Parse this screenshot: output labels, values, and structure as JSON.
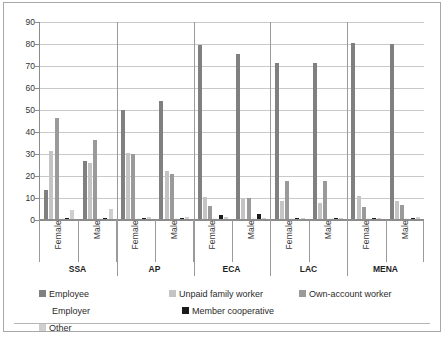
{
  "chart_data": {
    "type": "bar",
    "title": "",
    "subtitle": "",
    "xlabel": "",
    "ylabel": "",
    "ylim": [
      0,
      90
    ],
    "ytick_step": 10,
    "yticks": [
      "0",
      "10",
      "20",
      "30",
      "40",
      "50",
      "60",
      "70",
      "80",
      "90"
    ],
    "grid": true,
    "legend_position": "bottom",
    "group_labels": [
      "SSA",
      "AP",
      "ECA",
      "LAC",
      "MENA"
    ],
    "subgroup_labels": [
      "Female",
      "Male"
    ],
    "categories": [
      "SSA Female",
      "SSA Male",
      "AP Female",
      "AP Male",
      "ECA Female",
      "ECA Male",
      "LAC Female",
      "LAC Male",
      "MENA Female",
      "MENA Male"
    ],
    "series": [
      {
        "name": "Employee",
        "color": "#808080",
        "values": [
          13,
          26.5,
          49.5,
          53.5,
          79,
          75,
          71,
          71,
          80,
          79.5
        ]
      },
      {
        "name": "Unpaid family worker",
        "color": "#c4c4c4",
        "values": [
          31,
          25.5,
          30,
          22,
          10,
          9.5,
          8,
          7.5,
          10.5,
          8
        ]
      },
      {
        "name": "Own-account worker",
        "color": "#9a9a9a",
        "values": [
          46,
          36,
          29.5,
          20.5,
          6,
          9.5,
          17.5,
          17.5,
          5.5,
          6.5
        ]
      },
      {
        "name": "Employer",
        "color": "#f2f2f2",
        "values": [
          0.5,
          0.5,
          0.5,
          0.5,
          0.3,
          0.3,
          0.3,
          0.3,
          0.3,
          0.3
        ]
      },
      {
        "name": "Member cooperative",
        "color": "#1a1a1a",
        "values": [
          0,
          0,
          0.3,
          0.3,
          2,
          2.5,
          0.2,
          0.2,
          0,
          0
        ]
      },
      {
        "name": "Other",
        "color": "#cfcfcf",
        "values": [
          4,
          4.5,
          1,
          1,
          1,
          0.5,
          0.5,
          0.5,
          0.5,
          0.8
        ]
      }
    ]
  },
  "legend": {
    "items": [
      {
        "label": "Employee",
        "swatch": "e0"
      },
      {
        "label": "Unpaid family worker",
        "swatch": "e1"
      },
      {
        "label": "Own-account worker",
        "swatch": "e2"
      },
      {
        "label": "Employer",
        "swatch": "e3"
      },
      {
        "label": "Member cooperative",
        "swatch": "e4"
      },
      {
        "label": "Other",
        "swatch": "e5"
      }
    ]
  }
}
